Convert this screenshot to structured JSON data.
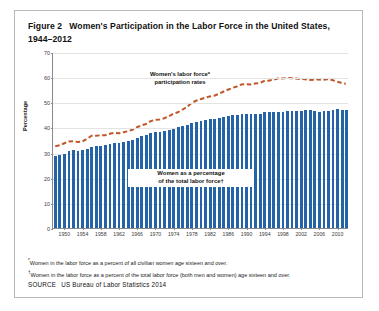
{
  "figure": {
    "number": "Figure 2",
    "title": "Women's Participation in the Labor Force in the United States, 1944–2012",
    "footnote_1_marker": "*",
    "footnote_1": "Women in the labor force as a percent of all civilian women age sixteen and over.",
    "footnote_2_marker": "†",
    "footnote_2": "Women in the labor force as a percent of the total labor force (both men and women) age sixteen and over.",
    "source_label": "SOURCE",
    "source_text": "US Bureau of Labor Statistics 2014"
  },
  "annotations": {
    "line_annotation_line1": "Women's labor force*",
    "line_annotation_line2": "participation rates",
    "bar_annotation_line1": "Women as a percentage",
    "bar_annotation_line2": "of the total labor force†"
  },
  "colors": {
    "bar": "#2563a8",
    "line": "#c0572a",
    "grid": "#e3e3e3",
    "axis": "#8a8a8a",
    "frame": "#b9b9b9"
  },
  "chart_data": {
    "type": "bar",
    "title": "Women's Participation in the Labor Force in the United States, 1944–2012",
    "xlabel": "",
    "ylabel": "Percentage",
    "ylim": [
      0,
      70
    ],
    "yticks": [
      0,
      10,
      20,
      30,
      40,
      50,
      60,
      70
    ],
    "grid": true,
    "legend": "none",
    "xticks": [
      1950,
      1954,
      1958,
      1962,
      1966,
      1970,
      1974,
      1978,
      1982,
      1986,
      1990,
      1994,
      1998,
      2002,
      2006,
      2010
    ],
    "x": [
      1948,
      1949,
      1950,
      1951,
      1952,
      1953,
      1954,
      1955,
      1956,
      1957,
      1958,
      1959,
      1960,
      1961,
      1962,
      1963,
      1964,
      1965,
      1966,
      1967,
      1968,
      1969,
      1970,
      1971,
      1972,
      1973,
      1974,
      1975,
      1976,
      1977,
      1978,
      1979,
      1980,
      1981,
      1982,
      1983,
      1984,
      1985,
      1986,
      1987,
      1988,
      1989,
      1990,
      1991,
      1992,
      1993,
      1994,
      1995,
      1996,
      1997,
      1998,
      1999,
      2000,
      2001,
      2002,
      2003,
      2004,
      2005,
      2006,
      2007,
      2008,
      2009,
      2010,
      2011,
      2012
    ],
    "series": [
      {
        "name": "Women as a percentage of the total labor force†",
        "type": "bar",
        "values": [
          28.6,
          28.9,
          29.6,
          30.8,
          31.0,
          30.8,
          30.9,
          31.6,
          32.2,
          32.5,
          32.7,
          32.9,
          33.4,
          33.8,
          34.0,
          34.4,
          34.8,
          35.2,
          36.0,
          36.7,
          37.1,
          37.8,
          38.1,
          38.2,
          38.5,
          38.9,
          39.4,
          40.0,
          40.5,
          41.0,
          41.7,
          42.1,
          42.5,
          43.0,
          43.3,
          43.5,
          43.8,
          44.2,
          44.5,
          44.8,
          45.0,
          45.2,
          45.2,
          45.4,
          45.5,
          45.5,
          46.0,
          46.1,
          46.2,
          46.2,
          46.3,
          46.5,
          46.6,
          46.6,
          46.6,
          47.0,
          46.8,
          46.4,
          46.3,
          46.4,
          46.5,
          46.8,
          47.2,
          47.0,
          46.9
        ]
      },
      {
        "name": "Women's labor force* participation rates",
        "type": "line",
        "style": "dashed",
        "values": [
          32.7,
          33.1,
          33.9,
          34.6,
          34.7,
          34.4,
          34.6,
          35.7,
          36.9,
          36.9,
          37.1,
          37.1,
          37.7,
          38.1,
          37.9,
          38.3,
          38.7,
          39.3,
          40.3,
          41.1,
          41.6,
          42.7,
          43.3,
          43.4,
          43.9,
          44.7,
          45.7,
          46.3,
          47.3,
          48.4,
          50.0,
          50.9,
          51.5,
          52.1,
          52.6,
          52.9,
          53.6,
          54.5,
          55.3,
          56.0,
          56.6,
          57.4,
          57.5,
          57.4,
          57.8,
          57.9,
          58.8,
          58.9,
          59.3,
          59.8,
          59.8,
          60.0,
          59.9,
          59.8,
          59.6,
          59.5,
          59.2,
          59.3,
          59.4,
          59.3,
          59.5,
          59.2,
          58.6,
          58.1,
          57.7
        ]
      }
    ]
  }
}
